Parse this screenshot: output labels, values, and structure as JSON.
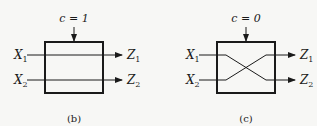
{
  "diagrams": [
    {
      "id": "b",
      "control_label": "c = 1",
      "caption": "(b)",
      "mode": "straight",
      "inputs": [
        {
          "name": "X",
          "sub": "1"
        },
        {
          "name": "X",
          "sub": "2"
        }
      ],
      "outputs": [
        {
          "name": "Z",
          "sub": "1"
        },
        {
          "name": "Z",
          "sub": "2"
        }
      ]
    },
    {
      "id": "c",
      "control_label": "c = 0",
      "caption": "(c)",
      "mode": "crossed",
      "inputs": [
        {
          "name": "X",
          "sub": "1"
        },
        {
          "name": "X",
          "sub": "2"
        }
      ],
      "outputs": [
        {
          "name": "Z",
          "sub": "1"
        },
        {
          "name": "Z",
          "sub": "2"
        }
      ]
    }
  ]
}
